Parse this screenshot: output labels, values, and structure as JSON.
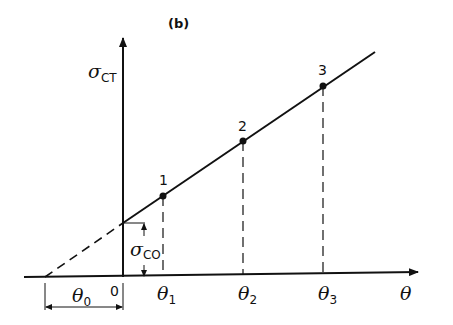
{
  "figure": {
    "panel_label": "(b)",
    "y_axis_label": {
      "symbol": "σ",
      "subscript": "CT"
    },
    "x_axis_label": {
      "symbol": "θ",
      "subscript": ""
    },
    "intercept_label": {
      "symbol": "σ",
      "subscript": "CO"
    },
    "offset_label": {
      "symbol": "θ",
      "subscript": "0"
    },
    "origin_label": "0",
    "points": [
      {
        "label": "1",
        "x_tick": {
          "symbol": "θ",
          "subscript": "1"
        }
      },
      {
        "label": "2",
        "x_tick": {
          "symbol": "θ",
          "subscript": "2"
        }
      },
      {
        "label": "3",
        "x_tick": {
          "symbol": "θ",
          "subscript": "3"
        }
      }
    ]
  },
  "colors": {
    "ink": "#111111",
    "background": "#ffffff"
  }
}
